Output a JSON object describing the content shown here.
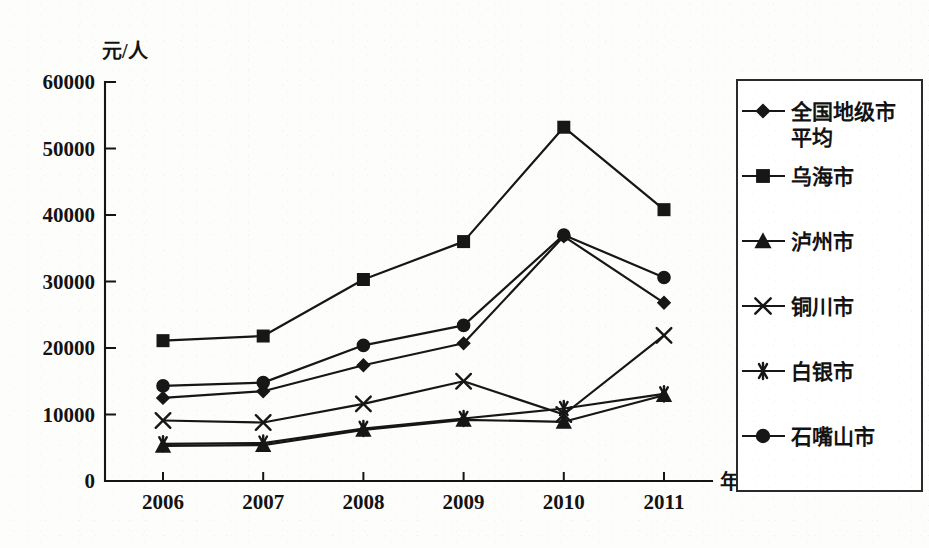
{
  "chart_data": {
    "type": "line",
    "title": "",
    "xlabel": "年份",
    "ylabel": "元/人",
    "x": [
      "2006",
      "2007",
      "2008",
      "2009",
      "2010",
      "2011"
    ],
    "categories": [
      "2006",
      "2007",
      "2008",
      "2009",
      "2010",
      "2011"
    ],
    "ylim": [
      0,
      60000
    ],
    "ytick_values": [
      0,
      10000,
      20000,
      30000,
      40000,
      50000,
      60000
    ],
    "ytick_labels": [
      "0",
      "10000",
      "20000",
      "30000",
      "40000",
      "50000",
      "60000"
    ],
    "grid": false,
    "legend_position": "right",
    "series": [
      {
        "name": "全国地级市平均",
        "marker": "diamond",
        "values": [
          12500,
          13500,
          17400,
          20700,
          36800,
          26800
        ]
      },
      {
        "name": "乌海市",
        "marker": "square",
        "values": [
          21100,
          21800,
          30300,
          36000,
          53200,
          40800
        ]
      },
      {
        "name": "泸州市",
        "marker": "triangle",
        "values": [
          5300,
          5400,
          7700,
          9200,
          8900,
          12900
        ]
      },
      {
        "name": "铜川市",
        "marker": "cross",
        "values": [
          9100,
          8800,
          11600,
          15000,
          10000,
          21900
        ]
      },
      {
        "name": "白银市",
        "marker": "asterisk",
        "values": [
          5600,
          5700,
          7900,
          9400,
          10900,
          13100
        ]
      },
      {
        "name": "石嘴山市",
        "marker": "circle",
        "values": [
          14300,
          14800,
          20400,
          23400,
          37000,
          30600
        ]
      }
    ]
  },
  "axes": {
    "y_unit_label": "元/人",
    "x_axis_label": "年份"
  },
  "legend": {
    "entries": [
      {
        "label": "全国地级市平均",
        "marker": "diamond"
      },
      {
        "label": "乌海市",
        "marker": "square"
      },
      {
        "label": "泸州市",
        "marker": "triangle"
      },
      {
        "label": "铜川市",
        "marker": "cross"
      },
      {
        "label": "白银市",
        "marker": "asterisk"
      },
      {
        "label": "石嘴山市",
        "marker": "circle"
      }
    ]
  },
  "style": {
    "ink": "#171717",
    "paper": "#fdfdfc"
  }
}
